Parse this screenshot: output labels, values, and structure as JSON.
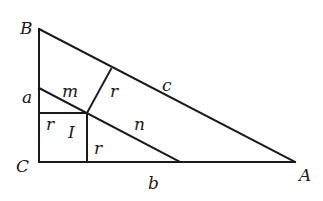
{
  "diagram": {
    "vertices": {
      "B": {
        "label": "B",
        "x": 39,
        "y": 29
      },
      "C": {
        "label": "C",
        "x": 39,
        "y": 162
      },
      "A": {
        "label": "A",
        "x": 295,
        "y": 162
      }
    },
    "incenter": {
      "label": "I",
      "x": 87,
      "y": 113
    },
    "sides": {
      "a": "a",
      "b": "b",
      "c": "c"
    },
    "segments": {
      "m": "m",
      "n": "n",
      "r_left": "r",
      "r_bottom": "r",
      "r_hyp": "r"
    },
    "colors": {
      "stroke": "#1a1a1a",
      "background": "#ffffff"
    }
  }
}
